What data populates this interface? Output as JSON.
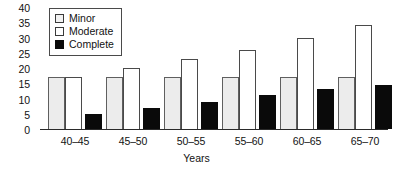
{
  "chart_data": {
    "type": "bar",
    "title": "",
    "xlabel": "Years",
    "ylabel": "",
    "categories": [
      "40–45",
      "45–50",
      "50–55",
      "55–60",
      "60–65",
      "65–70"
    ],
    "series": [
      {
        "name": "Minor",
        "values": [
          17,
          17,
          17,
          17,
          17,
          17
        ],
        "color": "#ececec"
      },
      {
        "name": "Moderate",
        "values": [
          17,
          20,
          23,
          26,
          30,
          34
        ],
        "color": "#ffffff"
      },
      {
        "name": "Complete",
        "values": [
          5,
          7,
          9,
          11,
          13,
          14.5
        ],
        "color": "#0a0a0a"
      }
    ],
    "ylim": [
      0,
      40
    ],
    "ytick_labels": [
      "0",
      "5",
      "10",
      "15",
      "20",
      "25",
      "30",
      "35",
      "40"
    ],
    "yticks": [
      0,
      5,
      10,
      15,
      20,
      25,
      30,
      35,
      40
    ],
    "grid": false,
    "legend_position": "upper left",
    "legend_entries": [
      "Minor",
      "Moderate",
      "Complete"
    ]
  }
}
